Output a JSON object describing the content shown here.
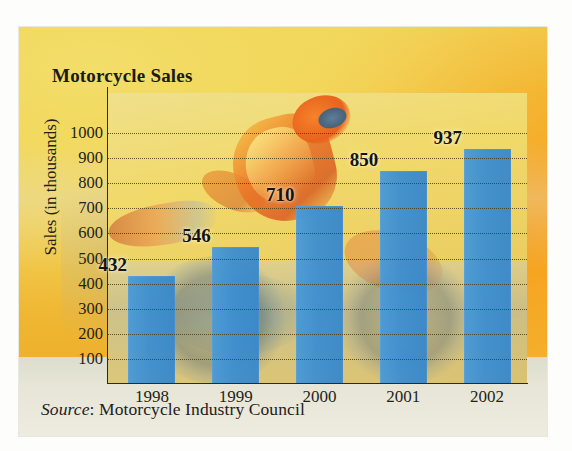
{
  "card": {
    "title": "Motorcycle Sales",
    "source_prefix": "Source",
    "source_separator": ": ",
    "source_text": "Motorcycle Industry Council"
  },
  "colors": {
    "bar": "#3f93d4",
    "panel_top": "#f0db63",
    "panel_bottom": "#eeb12c",
    "text": "#241f18",
    "gridline": "#4a3c14",
    "footer": "#e6e5d6"
  },
  "chart_data": {
    "type": "bar",
    "title": "Motorcycle Sales",
    "xlabel": "",
    "ylabel": "Sales (in thousands)",
    "categories": [
      "1998",
      "1999",
      "2000",
      "2001",
      "2002"
    ],
    "values": [
      432,
      546,
      710,
      850,
      937
    ],
    "data_labels": [
      "432",
      "546",
      "710",
      "850",
      "937"
    ],
    "ylim": [
      0,
      1000
    ],
    "ytick_step": 100,
    "yticks": [
      "1000",
      "900",
      "800",
      "700",
      "600",
      "500",
      "400",
      "300",
      "200",
      "100"
    ],
    "ytick_values": [
      1000,
      900,
      800,
      700,
      600,
      500,
      400,
      300,
      200,
      100
    ],
    "grid": "horizontal-dotted",
    "legend": "none",
    "series": [
      {
        "name": "Sales (in thousands)",
        "values": [
          432,
          546,
          710,
          850,
          937
        ]
      }
    ]
  }
}
